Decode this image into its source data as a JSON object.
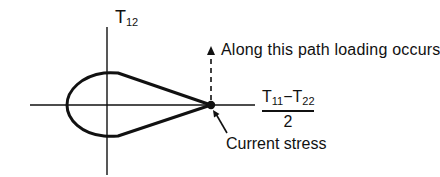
{
  "diagram": {
    "type": "stress-space yield surface",
    "vertical_axis": {
      "symbol": "T",
      "subscript": "12"
    },
    "horizontal_axis": {
      "numerator_a": {
        "symbol": "T",
        "subscript": "11"
      },
      "operator": "−",
      "numerator_b": {
        "symbol": "T",
        "subscript": "22"
      },
      "denominator": "2"
    },
    "annotations": {
      "loading_path": "Along this path loading occurs",
      "current_point": "Current stress"
    },
    "colors": {
      "ink": "#111111",
      "background": "#ffffff"
    }
  }
}
